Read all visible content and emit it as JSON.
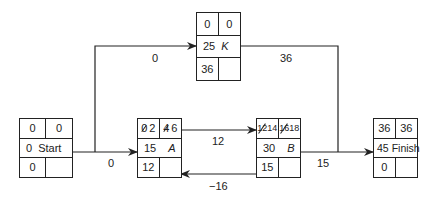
{
  "nodes": {
    "start": {
      "es": "0",
      "ef": "0",
      "dur": "0",
      "name": "Start",
      "slack": "0"
    },
    "k": {
      "es": "0",
      "ef": "0",
      "dur": "25",
      "name": "K",
      "slack": "36"
    },
    "a": {
      "es_old": "0",
      "es": "2",
      "ef_old": "4",
      "ef": "6",
      "dur": "15",
      "name": "A",
      "slack": "12"
    },
    "b": {
      "es_old": "12",
      "es": "14",
      "ef_old": "16",
      "ef": "18",
      "dur": "30",
      "name": "B",
      "slack": "15"
    },
    "finish": {
      "es": "36",
      "ef": "36",
      "dur": "45",
      "name": "Finish",
      "slack": "0"
    }
  },
  "edges": {
    "start_to_k": "0",
    "k_to_finish": "36",
    "start_to_a": "0",
    "a_to_b": "12",
    "b_to_a": "−16",
    "b_to_finish": "15"
  }
}
